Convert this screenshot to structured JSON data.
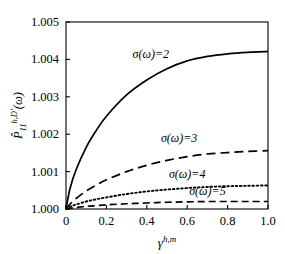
{
  "figure": {
    "background": "#ffffff",
    "line_color": "#000000",
    "axis_color": "#000000"
  },
  "chart_data": {
    "type": "line",
    "title": "",
    "xlabel": "γ h,m",
    "xlabel_base": "γ",
    "xlabel_sup": "h,m",
    "ylabel": "P̂ 11 h,D' (ω)",
    "ylabel_base": "P̂",
    "ylabel_sub": "11",
    "ylabel_sup": "h,D'",
    "ylabel_tail": "(ω)",
    "xlim": [
      0,
      1.0
    ],
    "ylim": [
      1.0,
      1.005
    ],
    "xticks": [
      0,
      0.2,
      0.4,
      0.6,
      0.8,
      1.0
    ],
    "xticklabels": [
      "0",
      "0.2",
      "0.4",
      "0.6",
      "0.8",
      "1.0"
    ],
    "yticks": [
      1.0,
      1.001,
      1.002,
      1.003,
      1.004,
      1.005
    ],
    "yticklabels": [
      "1.000",
      "1.001",
      "1.002",
      "1.003",
      "1.004",
      "1.005"
    ],
    "grid": false,
    "legend_position": "inline-annotations",
    "x": [
      0,
      0.02,
      0.05,
      0.1,
      0.15,
      0.2,
      0.3,
      0.4,
      0.5,
      0.6,
      0.7,
      0.8,
      0.9,
      1.0
    ],
    "series": [
      {
        "name": "σ(ω)=2",
        "sigma": 2,
        "style": "solid",
        "label": "σ(ω)=2",
        "label_x": 0.42,
        "label_y": 1.00405,
        "values": [
          1.0,
          1.00055,
          1.00105,
          1.00165,
          1.0021,
          1.00248,
          1.00305,
          1.00345,
          1.00375,
          1.00396,
          1.00408,
          1.00415,
          1.00419,
          1.00421
        ]
      },
      {
        "name": "σ(ω)=3",
        "sigma": 3,
        "style": "longdash",
        "label": "σ(ω)=3",
        "label_x": 0.56,
        "label_y": 1.00178,
        "values": [
          1.0,
          1.00013,
          1.00028,
          1.00048,
          1.00064,
          1.00078,
          1.001,
          1.00117,
          1.0013,
          1.0014,
          1.00147,
          1.00151,
          1.00154,
          1.00156
        ]
      },
      {
        "name": "σ(ω)=4",
        "sigma": 4,
        "style": "dotted",
        "label": "σ(ω)=4",
        "label_x": 0.6,
        "label_y": 1.00083,
        "values": [
          1.0,
          1.00006,
          1.00012,
          1.0002,
          1.00026,
          1.00031,
          1.0004,
          1.00047,
          1.00052,
          1.00056,
          1.00059,
          1.00061,
          1.00062,
          1.00063
        ]
      },
      {
        "name": "σ(ω)=5",
        "sigma": 5,
        "style": "dash",
        "label": "σ(ω)=5",
        "label_x": 0.7,
        "label_y": 1.00037,
        "values": [
          1.0,
          1.00002,
          1.00004,
          1.00007,
          1.00009,
          1.00011,
          1.00014,
          1.00016,
          1.00018,
          1.00019,
          1.0002,
          1.0002,
          1.0002,
          1.0002
        ]
      }
    ]
  }
}
